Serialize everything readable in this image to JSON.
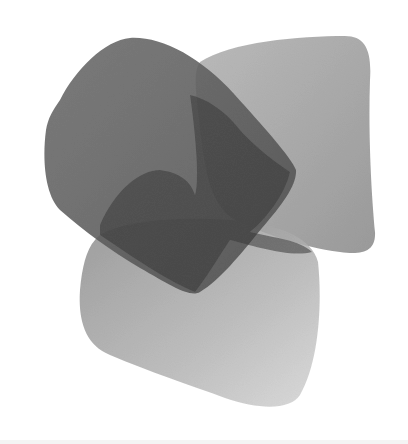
{
  "image": {
    "description": "Grayscale photo of three overlapping translucent rounded-square tiles on a white background",
    "background_color": "#ffffff",
    "shapes": [
      {
        "name": "top-right-tile",
        "fill": "#9a9a9a",
        "opacity": 0.85
      },
      {
        "name": "bottom-tile",
        "fill": "#a5a5a5",
        "opacity": 0.85
      },
      {
        "name": "top-left-tile",
        "fill": "#5f5f5f",
        "opacity": 0.88
      },
      {
        "name": "overlap-region",
        "fill": "#3f3f3f",
        "opacity": 0.75
      }
    ]
  }
}
